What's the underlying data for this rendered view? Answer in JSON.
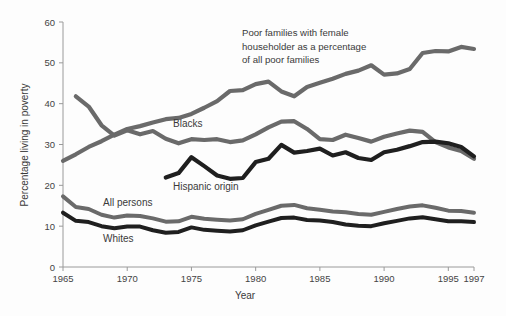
{
  "chart_data": {
    "type": "line",
    "title": "",
    "xlabel": "Year",
    "ylabel": "Percentage living in poverty",
    "xlim": [
      1965,
      1997
    ],
    "ylim": [
      0,
      60
    ],
    "ytick_step": 10,
    "grid": false,
    "legend": "inline-labels",
    "xticks": [
      "1965",
      "1970",
      "1975",
      "1980",
      "1985",
      "1990",
      "1995",
      "1997"
    ],
    "xtick_values": [
      1965,
      1970,
      1975,
      1980,
      1985,
      1990,
      1995,
      1997
    ],
    "yticks": [
      "0",
      "10",
      "20",
      "30",
      "40",
      "50",
      "60"
    ],
    "ytick_values": [
      0,
      10,
      20,
      30,
      40,
      50,
      60
    ],
    "colors": {
      "gray_series": "#6a6a6a",
      "black_series": "#1f1f1f",
      "axis": "#9a9a9a",
      "text": "#3a3a3a",
      "background": "#fdfdfd"
    },
    "annotations": [
      {
        "name": "female-householder-annotation",
        "lines": [
          "Poor families with female",
          "householder as a percentage",
          "of all poor families"
        ],
        "x": 242,
        "y": 36
      }
    ],
    "series": [
      {
        "name": "Poor families with female householder as a percentage of all poor families",
        "label": "",
        "color": "#6a6a6a",
        "width": 4.2,
        "label_x": 0,
        "label_y": 0,
        "x": [
          1965,
          1966,
          1967,
          1968,
          1969,
          1970,
          1971,
          1972,
          1973,
          1974,
          1975,
          1976,
          1977,
          1978,
          1979,
          1980,
          1981,
          1982,
          1983,
          1984,
          1985,
          1986,
          1987,
          1988,
          1989,
          1990,
          1991,
          1992,
          1993,
          1994,
          1995,
          1996,
          1997
        ],
        "values": [
          26.0,
          27.6,
          29.4,
          30.8,
          32.4,
          33.8,
          34.5,
          35.4,
          36.2,
          36.5,
          37.5,
          39.0,
          40.6,
          43.1,
          43.3,
          44.8,
          45.4,
          43.0,
          41.8,
          44.1,
          45.1,
          46.1,
          47.3,
          48.1,
          49.4,
          47.1,
          47.4,
          48.5,
          52.4,
          52.9,
          52.8,
          53.9,
          53.4
        ]
      },
      {
        "name": "Blacks",
        "label": "Blacks",
        "color": "#6a6a6a",
        "width": 4.2,
        "label_x": 173,
        "label_y": 127,
        "x": [
          1966,
          1967,
          1968,
          1969,
          1970,
          1971,
          1972,
          1973,
          1974,
          1975,
          1976,
          1977,
          1978,
          1979,
          1980,
          1981,
          1982,
          1983,
          1984,
          1985,
          1986,
          1987,
          1988,
          1989,
          1990,
          1991,
          1992,
          1993,
          1994,
          1995,
          1996,
          1997
        ],
        "values": [
          41.8,
          39.3,
          34.7,
          32.2,
          33.5,
          32.5,
          33.3,
          31.4,
          30.3,
          31.3,
          31.1,
          31.3,
          30.6,
          31.0,
          32.5,
          34.2,
          35.6,
          35.7,
          33.8,
          31.3,
          31.1,
          32.4,
          31.6,
          30.7,
          31.9,
          32.7,
          33.4,
          33.1,
          30.6,
          29.3,
          28.4,
          26.5
        ]
      },
      {
        "name": "Hispanic origin",
        "label": "Hispanic origin",
        "color": "#1f1f1f",
        "width": 4.2,
        "label_x": 173,
        "label_y": 190,
        "x": [
          1973,
          1974,
          1975,
          1976,
          1977,
          1978,
          1979,
          1980,
          1981,
          1982,
          1983,
          1984,
          1985,
          1986,
          1987,
          1988,
          1989,
          1990,
          1991,
          1992,
          1993,
          1994,
          1995,
          1996,
          1997
        ],
        "values": [
          21.9,
          23.0,
          26.9,
          24.7,
          22.4,
          21.6,
          21.8,
          25.7,
          26.5,
          29.9,
          28.0,
          28.4,
          29.0,
          27.3,
          28.1,
          26.7,
          26.2,
          28.1,
          28.7,
          29.6,
          30.6,
          30.7,
          30.3,
          29.4,
          27.1
        ]
      },
      {
        "name": "All persons",
        "label": "All persons",
        "color": "#6a6a6a",
        "width": 4.0,
        "label_x": 103,
        "label_y": 206,
        "x": [
          1965,
          1966,
          1967,
          1968,
          1969,
          1970,
          1971,
          1972,
          1973,
          1974,
          1975,
          1976,
          1977,
          1978,
          1979,
          1980,
          1981,
          1982,
          1983,
          1984,
          1985,
          1986,
          1987,
          1988,
          1989,
          1990,
          1991,
          1992,
          1993,
          1994,
          1995,
          1996,
          1997
        ],
        "values": [
          17.3,
          14.7,
          14.2,
          12.8,
          12.1,
          12.6,
          12.5,
          11.9,
          11.1,
          11.2,
          12.3,
          11.8,
          11.6,
          11.4,
          11.7,
          13.0,
          14.0,
          15.0,
          15.2,
          14.4,
          14.0,
          13.6,
          13.4,
          13.0,
          12.8,
          13.5,
          14.2,
          14.8,
          15.1,
          14.5,
          13.8,
          13.7,
          13.3
        ]
      },
      {
        "name": "Whites",
        "label": "Whites",
        "color": "#1f1f1f",
        "width": 4.0,
        "label_x": 103,
        "label_y": 242,
        "x": [
          1965,
          1966,
          1967,
          1968,
          1969,
          1970,
          1971,
          1972,
          1973,
          1974,
          1975,
          1976,
          1977,
          1978,
          1979,
          1980,
          1981,
          1982,
          1983,
          1984,
          1985,
          1986,
          1987,
          1988,
          1989,
          1990,
          1991,
          1992,
          1993,
          1994,
          1995,
          1996,
          1997
        ],
        "values": [
          13.3,
          11.3,
          11.0,
          10.0,
          9.5,
          9.9,
          9.9,
          9.0,
          8.4,
          8.6,
          9.7,
          9.1,
          8.9,
          8.7,
          9.0,
          10.2,
          11.1,
          12.0,
          12.1,
          11.5,
          11.4,
          11.0,
          10.4,
          10.1,
          10.0,
          10.7,
          11.3,
          11.9,
          12.2,
          11.7,
          11.2,
          11.2,
          11.0
        ]
      }
    ]
  },
  "axis_labels": {
    "x_title": "Year",
    "y_title": "Percentage living in poverty"
  }
}
